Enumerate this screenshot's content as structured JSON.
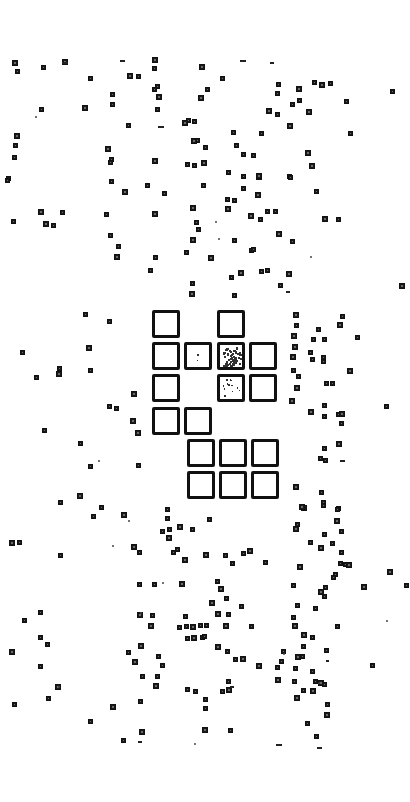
{
  "image": {
    "description": "Scanned binary image: scattered small dark squares with a central cluster of large outlined squares",
    "width": 410,
    "height": 802,
    "background": "#ffffff",
    "ink": "#111111"
  },
  "large_squares": {
    "size": 28,
    "border": 3,
    "items": [
      {
        "x": 152,
        "y": 310,
        "fill": "empty"
      },
      {
        "x": 217,
        "y": 310,
        "fill": "empty"
      },
      {
        "x": 152,
        "y": 342,
        "fill": "empty"
      },
      {
        "x": 184,
        "y": 342,
        "fill": "sparse"
      },
      {
        "x": 217,
        "y": 342,
        "fill": "dense-speckle"
      },
      {
        "x": 249,
        "y": 342,
        "fill": "empty"
      },
      {
        "x": 152,
        "y": 374,
        "fill": "empty"
      },
      {
        "x": 217,
        "y": 374,
        "fill": "light-speckle"
      },
      {
        "x": 249,
        "y": 374,
        "fill": "empty"
      },
      {
        "x": 152,
        "y": 407,
        "fill": "empty"
      },
      {
        "x": 184,
        "y": 407,
        "fill": "empty"
      },
      {
        "x": 187,
        "y": 439,
        "fill": "empty"
      },
      {
        "x": 219,
        "y": 439,
        "fill": "empty"
      },
      {
        "x": 251,
        "y": 439,
        "fill": "empty"
      },
      {
        "x": 187,
        "y": 471,
        "fill": "empty"
      },
      {
        "x": 219,
        "y": 471,
        "fill": "empty"
      },
      {
        "x": 251,
        "y": 471,
        "fill": "empty"
      }
    ]
  },
  "small_squares": [
    [
      15,
      63
    ],
    [
      17,
      71
    ],
    [
      43,
      67
    ],
    [
      65,
      62
    ],
    [
      90,
      78
    ],
    [
      41,
      109
    ],
    [
      85,
      108
    ],
    [
      112,
      94
    ],
    [
      112,
      104
    ],
    [
      130,
      76
    ],
    [
      138,
      76
    ],
    [
      154,
      68
    ],
    [
      155,
      60
    ],
    [
      157,
      86
    ],
    [
      154,
      89
    ],
    [
      159,
      97
    ],
    [
      128,
      125
    ],
    [
      157,
      109
    ],
    [
      17,
      136
    ],
    [
      15,
      145
    ],
    [
      14,
      157
    ],
    [
      108,
      149
    ],
    [
      111,
      159
    ],
    [
      188,
      120
    ],
    [
      185,
      123
    ],
    [
      194,
      121
    ],
    [
      197,
      140
    ],
    [
      194,
      141
    ],
    [
      187,
      164
    ],
    [
      194,
      165
    ],
    [
      155,
      161
    ],
    [
      110,
      162
    ],
    [
      8,
      178
    ],
    [
      202,
      67
    ],
    [
      222,
      78
    ],
    [
      207,
      89
    ],
    [
      201,
      98
    ],
    [
      278,
      84
    ],
    [
      277,
      93
    ],
    [
      299,
      89
    ],
    [
      299,
      100
    ],
    [
      314,
      82
    ],
    [
      322,
      85
    ],
    [
      330,
      83
    ],
    [
      292,
      104
    ],
    [
      309,
      112
    ],
    [
      346,
      101
    ],
    [
      392,
      91
    ],
    [
      269,
      111
    ],
    [
      277,
      114
    ],
    [
      261,
      133
    ],
    [
      308,
      153
    ],
    [
      233,
      132
    ],
    [
      350,
      133
    ],
    [
      204,
      163
    ],
    [
      243,
      154
    ],
    [
      253,
      155
    ],
    [
      290,
      126
    ],
    [
      236,
      145
    ],
    [
      205,
      147
    ],
    [
      259,
      177
    ],
    [
      289,
      176
    ],
    [
      228,
      172
    ],
    [
      312,
      166
    ],
    [
      7,
      180
    ],
    [
      111,
      181
    ],
    [
      125,
      192
    ],
    [
      147,
      185
    ],
    [
      164,
      193
    ],
    [
      41,
      212
    ],
    [
      62,
      212
    ],
    [
      13,
      221
    ],
    [
      46,
      224
    ],
    [
      53,
      225
    ],
    [
      106,
      214
    ],
    [
      155,
      214
    ],
    [
      110,
      235
    ],
    [
      118,
      246
    ],
    [
      117,
      257
    ],
    [
      155,
      257
    ],
    [
      150,
      270
    ],
    [
      193,
      208
    ],
    [
      196,
      222
    ],
    [
      198,
      229
    ],
    [
      193,
      240
    ],
    [
      186,
      252
    ],
    [
      192,
      283
    ],
    [
      192,
      294
    ],
    [
      203,
      185
    ],
    [
      243,
      176
    ],
    [
      259,
      176
    ],
    [
      290,
      177
    ],
    [
      243,
      188
    ],
    [
      258,
      195
    ],
    [
      227,
      199
    ],
    [
      234,
      200
    ],
    [
      228,
      209
    ],
    [
      267,
      211
    ],
    [
      316,
      191
    ],
    [
      251,
      216
    ],
    [
      275,
      211
    ],
    [
      260,
      219
    ],
    [
      325,
      219
    ],
    [
      338,
      219
    ],
    [
      234,
      240
    ],
    [
      279,
      234
    ],
    [
      292,
      241
    ],
    [
      251,
      250
    ],
    [
      211,
      258
    ],
    [
      253,
      249
    ],
    [
      267,
      270
    ],
    [
      241,
      273
    ],
    [
      231,
      277
    ],
    [
      261,
      271
    ],
    [
      289,
      274
    ],
    [
      280,
      285
    ],
    [
      234,
      295
    ],
    [
      402,
      286
    ],
    [
      85,
      314
    ],
    [
      109,
      321
    ],
    [
      89,
      348
    ],
    [
      22,
      352
    ],
    [
      59,
      368
    ],
    [
      59,
      374
    ],
    [
      36,
      377
    ],
    [
      90,
      370
    ],
    [
      134,
      394
    ],
    [
      109,
      406
    ],
    [
      116,
      408
    ],
    [
      133,
      421
    ],
    [
      44,
      430
    ],
    [
      80,
      443
    ],
    [
      138,
      433
    ],
    [
      90,
      466
    ],
    [
      138,
      465
    ],
    [
      80,
      496
    ],
    [
      60,
      502
    ],
    [
      101,
      507
    ],
    [
      296,
      315
    ],
    [
      342,
      316
    ],
    [
      296,
      325
    ],
    [
      340,
      325
    ],
    [
      318,
      329
    ],
    [
      357,
      337
    ],
    [
      294,
      336
    ],
    [
      313,
      339
    ],
    [
      324,
      339
    ],
    [
      295,
      347
    ],
    [
      310,
      352
    ],
    [
      323,
      357
    ],
    [
      293,
      357
    ],
    [
      323,
      361
    ],
    [
      312,
      359
    ],
    [
      350,
      371
    ],
    [
      293,
      370
    ],
    [
      298,
      376
    ],
    [
      297,
      388
    ],
    [
      326,
      383
    ],
    [
      332,
      383
    ],
    [
      292,
      401
    ],
    [
      324,
      405
    ],
    [
      386,
      406
    ],
    [
      311,
      412
    ],
    [
      324,
      416
    ],
    [
      338,
      414
    ],
    [
      342,
      414
    ],
    [
      341,
      423
    ],
    [
      324,
      448
    ],
    [
      339,
      444
    ],
    [
      320,
      458
    ],
    [
      325,
      460
    ],
    [
      296,
      487
    ],
    [
      321,
      492
    ],
    [
      323,
      502
    ],
    [
      304,
      508
    ],
    [
      338,
      508
    ],
    [
      93,
      516
    ],
    [
      124,
      515
    ],
    [
      167,
      509
    ],
    [
      167,
      518
    ],
    [
      180,
      527
    ],
    [
      192,
      529
    ],
    [
      169,
      529
    ],
    [
      12,
      543
    ],
    [
      19,
      542
    ],
    [
      60,
      555
    ],
    [
      134,
      547
    ],
    [
      139,
      552
    ],
    [
      162,
      531
    ],
    [
      169,
      538
    ],
    [
      173,
      552
    ],
    [
      177,
      549
    ],
    [
      185,
      560
    ],
    [
      139,
      584
    ],
    [
      154,
      584
    ],
    [
      182,
      584
    ],
    [
      40,
      612
    ],
    [
      24,
      620
    ],
    [
      140,
      615
    ],
    [
      152,
      615
    ],
    [
      185,
      616
    ],
    [
      151,
      626
    ],
    [
      179,
      627
    ],
    [
      186,
      626
    ],
    [
      193,
      627
    ],
    [
      200,
      625
    ],
    [
      209,
      519
    ],
    [
      302,
      507
    ],
    [
      323,
      505
    ],
    [
      337,
      509
    ],
    [
      337,
      521
    ],
    [
      297,
      524
    ],
    [
      341,
      531
    ],
    [
      296,
      529
    ],
    [
      324,
      534
    ],
    [
      310,
      542
    ],
    [
      321,
      548
    ],
    [
      332,
      543
    ],
    [
      341,
      552
    ],
    [
      206,
      555
    ],
    [
      225,
      555
    ],
    [
      232,
      563
    ],
    [
      250,
      551
    ],
    [
      243,
      553
    ],
    [
      265,
      562
    ],
    [
      300,
      567
    ],
    [
      340,
      563
    ],
    [
      345,
      564
    ],
    [
      349,
      565
    ],
    [
      335,
      574
    ],
    [
      333,
      577
    ],
    [
      390,
      572
    ],
    [
      406,
      585
    ],
    [
      217,
      581
    ],
    [
      221,
      589
    ],
    [
      293,
      585
    ],
    [
      325,
      587
    ],
    [
      321,
      592
    ],
    [
      324,
      596
    ],
    [
      226,
      598
    ],
    [
      212,
      603
    ],
    [
      241,
      606
    ],
    [
      297,
      605
    ],
    [
      218,
      614
    ],
    [
      228,
      614
    ],
    [
      206,
      625
    ],
    [
      226,
      626
    ],
    [
      251,
      626
    ],
    [
      293,
      617
    ],
    [
      295,
      626
    ],
    [
      337,
      626
    ],
    [
      315,
      608
    ],
    [
      364,
      587
    ],
    [
      40,
      637
    ],
    [
      47,
      644
    ],
    [
      12,
      652
    ],
    [
      40,
      666
    ],
    [
      187,
      638
    ],
    [
      194,
      638
    ],
    [
      202,
      637
    ],
    [
      128,
      652
    ],
    [
      141,
      646
    ],
    [
      158,
      656
    ],
    [
      162,
      665
    ],
    [
      135,
      662
    ],
    [
      142,
      676
    ],
    [
      157,
      676
    ],
    [
      156,
      686
    ],
    [
      187,
      689
    ],
    [
      195,
      691
    ],
    [
      58,
      687
    ],
    [
      48,
      698
    ],
    [
      14,
      704
    ],
    [
      113,
      707
    ],
    [
      140,
      701
    ],
    [
      90,
      721
    ],
    [
      142,
      732
    ],
    [
      123,
      740
    ],
    [
      204,
      636
    ],
    [
      304,
      635
    ],
    [
      312,
      637
    ],
    [
      303,
      646
    ],
    [
      218,
      647
    ],
    [
      227,
      651
    ],
    [
      235,
      659
    ],
    [
      243,
      659
    ],
    [
      283,
      651
    ],
    [
      326,
      650
    ],
    [
      298,
      657
    ],
    [
      302,
      656
    ],
    [
      281,
      661
    ],
    [
      259,
      666
    ],
    [
      277,
      667
    ],
    [
      295,
      668
    ],
    [
      278,
      680
    ],
    [
      312,
      671
    ],
    [
      228,
      681
    ],
    [
      229,
      690
    ],
    [
      294,
      681
    ],
    [
      315,
      681
    ],
    [
      321,
      683
    ],
    [
      324,
      684
    ],
    [
      303,
      690
    ],
    [
      313,
      691
    ],
    [
      222,
      691
    ],
    [
      205,
      699
    ],
    [
      297,
      698
    ],
    [
      327,
      704
    ],
    [
      205,
      708
    ],
    [
      327,
      715
    ],
    [
      230,
      730
    ],
    [
      307,
      723
    ],
    [
      205,
      730
    ],
    [
      316,
      736
    ],
    [
      372,
      665
    ]
  ],
  "dashes": [
    [
      62,
      62,
      6
    ],
    [
      120,
      60,
      5
    ],
    [
      240,
      60,
      6
    ],
    [
      270,
      62,
      4
    ],
    [
      158,
      126,
      6
    ],
    [
      286,
      291,
      4
    ],
    [
      340,
      460,
      5
    ],
    [
      138,
      741,
      4
    ],
    [
      276,
      744,
      6
    ],
    [
      317,
      747,
      5
    ],
    [
      230,
      686,
      4
    ],
    [
      326,
      660,
      3
    ]
  ],
  "specks": [
    [
      35,
      116
    ],
    [
      218,
      238
    ],
    [
      310,
      256
    ],
    [
      215,
      221
    ],
    [
      98,
      460
    ],
    [
      128,
      520
    ],
    [
      112,
      545
    ],
    [
      162,
      582
    ],
    [
      140,
      612
    ],
    [
      58,
      686
    ],
    [
      194,
      743
    ],
    [
      283,
      653
    ],
    [
      386,
      620
    ],
    [
      318,
      682
    ]
  ]
}
